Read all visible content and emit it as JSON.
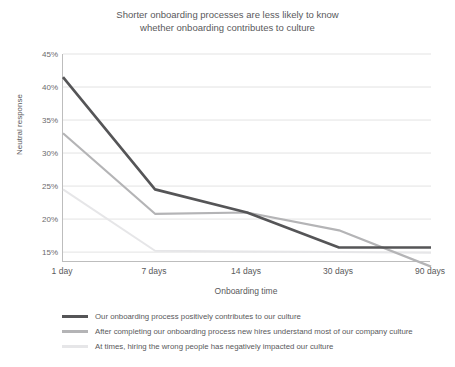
{
  "chart_data": {
    "type": "line",
    "title": "Shorter onboarding processes are less likely to know\nwhether onboarding contributes to culture",
    "xlabel": "Onboarding time",
    "ylabel": "Neutral response",
    "categories": [
      "1 day",
      "7 days",
      "14 days",
      "30 days",
      "90 days"
    ],
    "ytick_labels": [
      "45%",
      "40%",
      "35%",
      "30%",
      "25%",
      "20%",
      "15%"
    ],
    "ytick_values": [
      45,
      40,
      35,
      30,
      25,
      20,
      15
    ],
    "ylim": [
      13.5,
      45
    ],
    "grid": "horizontal",
    "legend_position": "below",
    "series": [
      {
        "name": "Our onboarding process positively contributes to our culture",
        "color": "#555557",
        "values": [
          41.5,
          24.5,
          21.0,
          15.7,
          15.7
        ]
      },
      {
        "name": "After completing our onboarding process new hires understand most of our company culture",
        "color": "#b4b4b6",
        "values": [
          33.0,
          20.8,
          21.0,
          18.3,
          12.8
        ]
      },
      {
        "name": "At times, hiring the wrong people has negatively impacted our culture",
        "color": "#e6e6e8",
        "values": [
          24.5,
          15.2,
          15.1,
          15.0,
          14.9
        ]
      }
    ]
  },
  "colors": {
    "axis": "#bdbdbd",
    "grid": "#e3e3e3",
    "text": "#59595b",
    "background": "#ffffff"
  }
}
